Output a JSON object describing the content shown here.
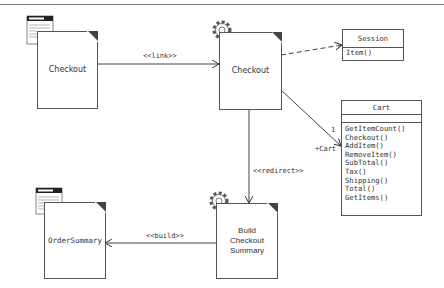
{
  "diagram": {
    "nodes": {
      "checkout_page": {
        "label": "Checkout",
        "icon": "web-form-icon"
      },
      "checkout_controller": {
        "label": "Checkout",
        "icon": "gear-icon"
      },
      "order_summary_page": {
        "label": "OrderSummary",
        "icon": "web-form-icon"
      },
      "build_controller": {
        "label_lines": [
          "Build",
          "Checkout",
          "Summary"
        ],
        "icon": "gear-icon"
      }
    },
    "classes": {
      "session": {
        "name": "Session",
        "operations": [
          "Item()"
        ]
      },
      "cart": {
        "name": "Cart",
        "operations": [
          "GetItemCount()",
          "Checkout()",
          "AddItem()",
          "RemoveItem()",
          "SubTotal()",
          "Tax()",
          "Shipping()",
          "Total()",
          "GetItems()"
        ]
      }
    },
    "edges": {
      "link": {
        "label": "<<link>>"
      },
      "redirect": {
        "label": "<<redirect>>"
      },
      "build": {
        "label": "<<build>>"
      },
      "cart_assoc": {
        "multiplicity": "1",
        "role": "+Cart"
      }
    }
  }
}
